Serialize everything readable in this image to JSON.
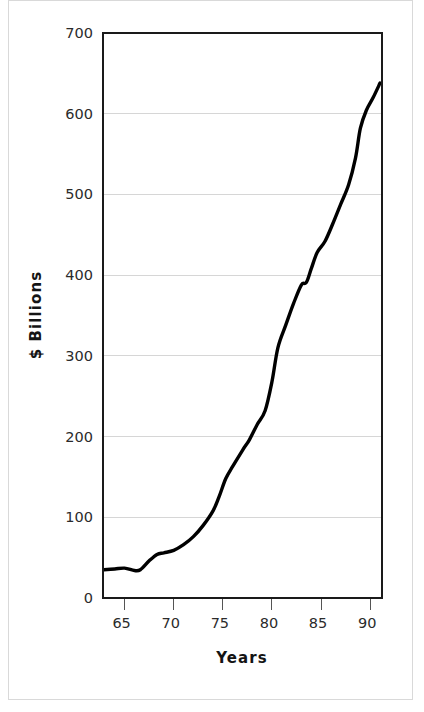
{
  "chart_data": {
    "type": "line",
    "title": "",
    "subtitle": "",
    "xlabel": "Years",
    "ylabel": "$ Billions",
    "xlim": [
      62.8,
      91.2
    ],
    "ylim": [
      0,
      700
    ],
    "grid": "horizontal",
    "legend": "none",
    "y_ticks": [
      0,
      100,
      200,
      300,
      400,
      500,
      600,
      700
    ],
    "y_tick_labels": [
      "0",
      "100",
      "200",
      "300",
      "400",
      "500",
      "600",
      "700"
    ],
    "x_ticks": [
      65,
      70,
      75,
      80,
      85,
      90
    ],
    "x_tick_labels": [
      "65",
      "70",
      "75",
      "80",
      "85",
      "90"
    ],
    "series": [
      {
        "name": "value",
        "color": "#000000",
        "x": [
          62.9,
          64.0,
          65.0,
          66.0,
          66.6,
          67.5,
          68.3,
          69.0,
          70.0,
          71.0,
          72.0,
          73.0,
          74.0,
          74.6,
          75.3,
          76.0,
          77.0,
          77.7,
          78.5,
          79.3,
          80.0,
          80.6,
          81.4,
          82.2,
          83.0,
          83.5,
          84.0,
          84.6,
          85.4,
          86.2,
          87.0,
          87.8,
          88.5,
          89.0,
          89.6,
          90.3,
          91.0
        ],
        "y": [
          35,
          36,
          37,
          34,
          35,
          46,
          54,
          56,
          59,
          66,
          76,
          90,
          108,
          125,
          148,
          163,
          183,
          196,
          215,
          232,
          268,
          310,
          338,
          365,
          388,
          391,
          408,
          428,
          442,
          464,
          488,
          512,
          545,
          582,
          604,
          620,
          638
        ]
      }
    ]
  },
  "axis": {
    "y_title": "$ Billions",
    "x_title": "Years"
  },
  "colors": {
    "line": "#000000",
    "grid": "#d6d6d6",
    "frame": "#1a1a1a",
    "page_border": "#d9d9d9",
    "tick_text": "#2b2b2b",
    "background": "#ffffff"
  }
}
